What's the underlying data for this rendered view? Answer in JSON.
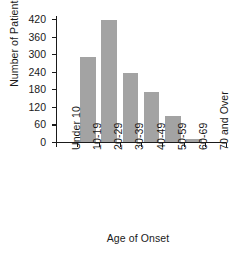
{
  "chart_data": {
    "type": "bar",
    "title": "",
    "xlabel": "Age of Onset",
    "ylabel": "Number of Patients",
    "categories": [
      "Under 10",
      "10-19",
      "20-29",
      "30-39",
      "40-49",
      "50-59",
      "60-69",
      "70 and Over"
    ],
    "values": [
      0,
      290,
      418,
      237,
      172,
      88,
      10,
      0
    ],
    "series": [
      {
        "name": "Number of Patients",
        "values": [
          0,
          290,
          418,
          237,
          172,
          88,
          10,
          0
        ]
      }
    ],
    "ylim": [
      0,
      420
    ],
    "ytick_labels": [
      "0",
      "60",
      "120",
      "180",
      "240",
      "300",
      "360",
      "420"
    ],
    "ytick_values": [
      0,
      60,
      120,
      180,
      240,
      300,
      360,
      420
    ],
    "grid": false,
    "legend": false,
    "legend_position": "none",
    "bar_color": "#a3a3a3",
    "axis_color": "#1a1a1a",
    "background_color": "#ffffff",
    "xtick_label_rotation": -90
  },
  "axes": {
    "x_title": "Age of Onset",
    "y_title": "Number of Patients"
  }
}
